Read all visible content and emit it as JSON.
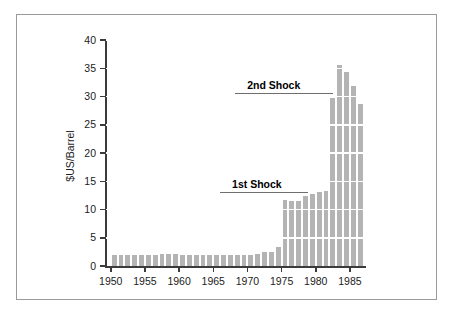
{
  "figure": {
    "border_color": "#9a9a9a",
    "background": "#ffffff"
  },
  "chart_data": {
    "type": "bar",
    "title": "",
    "subtitle": "",
    "xlabel": "",
    "ylabel": "$US/Barrel",
    "xlim": [
      1949.3,
      1987.2
    ],
    "ylim": [
      0,
      40
    ],
    "grid": true,
    "grid_color": "#ffffff",
    "grid_orientation": "horizontal",
    "bar_color": "#b4b4b4",
    "legend": null,
    "legend_position": "none",
    "ytick_labels": [
      "0",
      "5",
      "10",
      "15",
      "20",
      "25",
      "30",
      "35",
      "40"
    ],
    "ytick_values": [
      0,
      5,
      10,
      15,
      20,
      25,
      30,
      35,
      40
    ],
    "xtick_labels": [
      "1950",
      "1955",
      "1960",
      "1965",
      "1970",
      "1975",
      "1980",
      "1985"
    ],
    "xtick_values": [
      1950,
      1955,
      1960,
      1965,
      1970,
      1975,
      1980,
      1985
    ],
    "categories": [
      1950,
      1951,
      1952,
      1953,
      1954,
      1955,
      1956,
      1957,
      1958,
      1959,
      1960,
      1961,
      1962,
      1963,
      1964,
      1965,
      1966,
      1967,
      1968,
      1969,
      1970,
      1971,
      1972,
      1973,
      1974,
      1975,
      1976,
      1977,
      1978,
      1979,
      1980,
      1981,
      1982,
      1983,
      1984,
      1985,
      1986
    ],
    "values": [
      1.9,
      1.9,
      1.9,
      1.9,
      1.9,
      2.0,
      2.0,
      2.1,
      2.1,
      2.1,
      2.0,
      2.0,
      2.0,
      2.0,
      2.0,
      1.9,
      1.9,
      1.9,
      1.9,
      1.9,
      1.9,
      2.2,
      2.4,
      2.5,
      3.3,
      11.6,
      11.5,
      11.5,
      12.4,
      12.7,
      13.1,
      13.2,
      29.8,
      35.5,
      34.3,
      31.8,
      28.7
    ],
    "annotations": [
      {
        "label": "1st Shock",
        "value": 13.0,
        "x_start": 1966.0,
        "x_end": 1978.9
      },
      {
        "label": "2nd Shock",
        "value": 30.5,
        "x_start": 1968.2,
        "x_end": 1982.5
      }
    ]
  }
}
